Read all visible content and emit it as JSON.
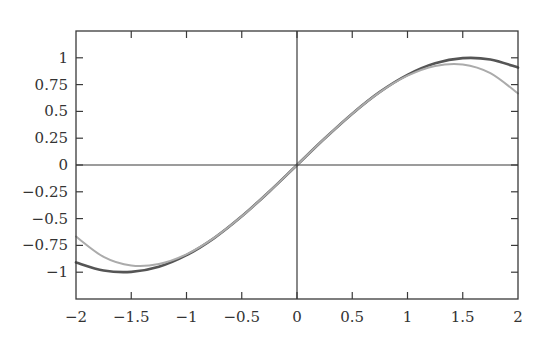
{
  "chart_data": {
    "type": "line",
    "title": "",
    "xlabel": "",
    "ylabel": "",
    "xlim": [
      -2,
      2
    ],
    "ylim": [
      -1.25,
      1.25
    ],
    "grid": false,
    "legend": null,
    "x_ticks": [
      -2,
      -1.5,
      -1,
      -0.5,
      0,
      0.5,
      1,
      1.5,
      2
    ],
    "x_tick_labels": [
      "−2",
      "−1.5",
      "−1",
      "−0.5",
      "0",
      "0.5",
      "1",
      "1.5",
      "2"
    ],
    "y_ticks": [
      -1,
      -0.75,
      -0.5,
      -0.25,
      0,
      0.25,
      0.5,
      0.75,
      1
    ],
    "y_tick_labels": [
      "−1",
      "−0.75",
      "−0.5",
      "−0.25",
      "0",
      "0.25",
      "0.5",
      "0.75",
      "1"
    ],
    "zero_axes": true,
    "x": [
      -2,
      -1.75,
      -1.5,
      -1.25,
      -1,
      -0.75,
      -0.5,
      -0.25,
      0,
      0.25,
      0.5,
      0.75,
      1,
      1.25,
      1.5,
      1.75,
      2
    ],
    "series": [
      {
        "name": "sin(x)",
        "color": "#555555",
        "width": 2.6,
        "values": [
          -0.909,
          -0.984,
          -0.997,
          -0.949,
          -0.841,
          -0.682,
          -0.479,
          -0.247,
          0,
          0.247,
          0.479,
          0.682,
          0.841,
          0.949,
          0.997,
          0.984,
          0.909
        ]
      },
      {
        "name": "x - x^3/6",
        "color": "#ababab",
        "width": 2.0,
        "values": [
          -0.667,
          -0.857,
          -0.938,
          -0.924,
          -0.833,
          -0.68,
          -0.479,
          -0.247,
          0,
          0.247,
          0.479,
          0.68,
          0.833,
          0.924,
          0.938,
          0.857,
          0.667
        ]
      }
    ]
  },
  "layout": {
    "plot_left": 76,
    "plot_right": 518,
    "plot_top": 31,
    "plot_bottom": 299
  }
}
